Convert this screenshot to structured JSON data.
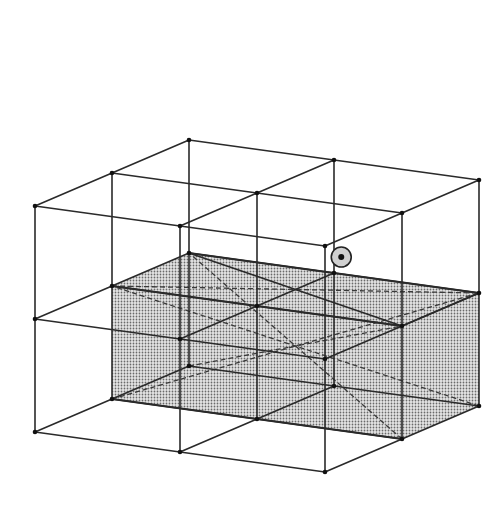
{
  "figure": {
    "type": "cubic-lattice-wireframe",
    "colors": {
      "line": "#2a2a2a",
      "vertex": "#111111",
      "shade": "#bdbdbd",
      "background": "#ffffff"
    },
    "projection": {
      "origin": [
        35,
        432
      ],
      "x_step": [
        145,
        20
      ],
      "y_step": [
        77,
        -33
      ],
      "z_step": [
        0,
        -113
      ]
    },
    "lattice": {
      "nx": 2,
      "ny": 2,
      "nz": 2
    },
    "shaded_cell": {
      "x": [
        0,
        2
      ],
      "y": [
        1,
        2
      ],
      "z": [
        0,
        1
      ]
    },
    "marked_point": {
      "label": "body-center",
      "circle_radius": 10
    }
  }
}
